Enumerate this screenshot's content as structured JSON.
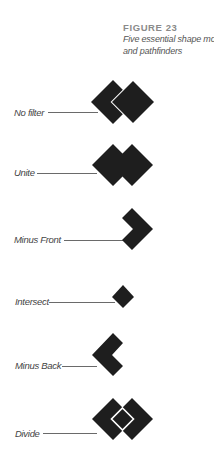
{
  "figure": {
    "number": "FIGURE 23",
    "title_line1": "Five essential shape modes",
    "title_line2": "and pathfinders"
  },
  "colors": {
    "shape_fill": "#1e1e1e",
    "gap_stroke": "#ffffff",
    "leader_line": "#6a6a6a",
    "label_text": "#444444"
  },
  "rows": [
    {
      "label": "No filter",
      "mode": "no-filter",
      "label_x": 14,
      "label_y": 107,
      "line_x1": 48,
      "line_x2": 98,
      "line_y": 112,
      "cy": 102
    },
    {
      "label": "Unite",
      "mode": "unite",
      "label_x": 14,
      "label_y": 167,
      "line_x1": 37,
      "line_x2": 97,
      "line_y": 173,
      "cy": 165
    },
    {
      "label": "Minus Front",
      "mode": "minus-front",
      "label_x": 14,
      "label_y": 234,
      "line_x1": 64,
      "line_x2": 135,
      "line_y": 240,
      "cy": 229
    },
    {
      "label": "Intersect",
      "mode": "intersect",
      "label_x": 15,
      "label_y": 296,
      "line_x1": 49,
      "line_x2": 115,
      "line_y": 302,
      "cy": 297
    },
    {
      "label": "Minus Back",
      "mode": "minus-back",
      "label_x": 15,
      "label_y": 360,
      "line_x1": 62,
      "line_x2": 97,
      "line_y": 366,
      "cy": 355
    },
    {
      "label": "Divide",
      "mode": "divide",
      "label_x": 15,
      "label_y": 428,
      "line_x1": 43,
      "line_x2": 97,
      "line_y": 433,
      "cy": 419
    }
  ]
}
